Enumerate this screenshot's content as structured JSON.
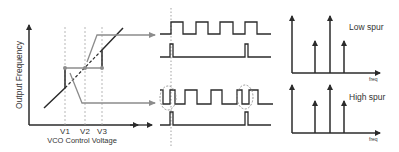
{
  "vco_plot": {
    "ylabel": "Output Frequency",
    "xlabel": "VCO Control Voltage",
    "voltage_labels": [
      "V1",
      "V2",
      "V3"
    ]
  },
  "spectra": [
    {
      "label": "Low spur",
      "axis_label": "freq",
      "spur_level": "low"
    },
    {
      "label": "High spur",
      "axis_label": "freq",
      "spur_level": "high"
    }
  ],
  "colors": {
    "line": "#2b2b2b",
    "gray": "#8c8c8c",
    "dashed": "#9a9a9a"
  }
}
